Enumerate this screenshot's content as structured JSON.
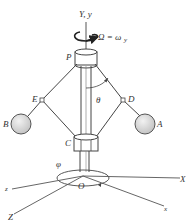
{
  "figure": {
    "type": "mechanism-diagram",
    "colors": {
      "line": "#444444",
      "ball_fill": "#d8d8d8",
      "ball_stroke": "#555555",
      "background": "#ffffff"
    },
    "labels": {
      "vertical_axis": "Y, y",
      "angular_velocity": "Ω = ω",
      "angular_velocity_subscript": "y",
      "top_collar": "P",
      "left_joint": "E",
      "right_joint": "D",
      "left_ball": "B",
      "right_ball": "A",
      "bottom_collar": "C",
      "angle_theta": "θ",
      "angle_phi": "φ",
      "origin": "O",
      "axis_X": "X",
      "axis_x": "x",
      "axis_z": "z",
      "axis_Z": "Z"
    }
  }
}
